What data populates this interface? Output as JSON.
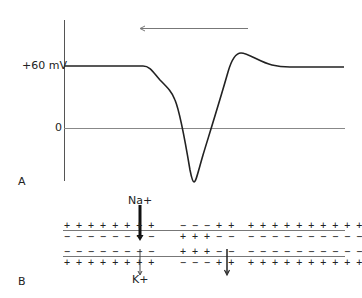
{
  "panel_a": {
    "label": "A",
    "y_labels": {
      "plus60": "+60 mV",
      "zero": "0"
    },
    "direction_arrow": "leftward propagation",
    "trace": "inverted action potential waveform: baseline at +60 mV, dips below 0, overshoots above baseline, returns to +60 mV"
  },
  "panel_b": {
    "label": "B",
    "ions": {
      "top": "Na+",
      "bottom": "K+"
    },
    "upper_membrane": {
      "left_top": "+ + + + + + + +",
      "left_bottom": "− − − − − − − −",
      "right_top_a": "− − − + +",
      "right_top_b": "+ + + + + + + + + +",
      "right_bottom_a": "+ + + − −",
      "right_bottom_b": "− − − − − − − − − −"
    },
    "lower_membrane": {
      "left_top": "− − − − − − − −",
      "left_bottom": "+ + + + + + + +",
      "right_top_a": "+ + + − −",
      "right_top_b": "− − − − − − − − − −",
      "right_bottom_a": "− − − + +",
      "right_bottom_b": "+ + + + + + + + + +"
    }
  },
  "colors": {
    "ink": "#222222",
    "line": "#777777"
  }
}
